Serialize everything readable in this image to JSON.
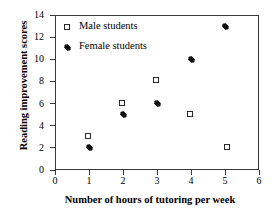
{
  "chart_data": {
    "type": "scatter",
    "title": "",
    "xlabel": "Number of hours of tutoring per week",
    "ylabel": "Reading improvement scores",
    "xlim": [
      0,
      6
    ],
    "ylim": [
      0,
      14
    ],
    "xticks": [
      "0",
      "1",
      "2",
      "3",
      "4",
      "5",
      "6"
    ],
    "yticks": [
      "0",
      "2",
      "4",
      "6",
      "8",
      "10",
      "12",
      "14"
    ],
    "grid": false,
    "legend_position": "top-left-inside",
    "frame": true,
    "series": [
      {
        "name": "Male students",
        "marker": "open-square",
        "color": "#2b2b2b",
        "points": [
          {
            "x": 1,
            "y": 3
          },
          {
            "x": 2,
            "y": 6
          },
          {
            "x": 3,
            "y": 8
          },
          {
            "x": 4,
            "y": 5
          },
          {
            "x": 5.1,
            "y": 2
          }
        ]
      },
      {
        "name": "Female students",
        "marker": "filled-diamond",
        "color": "#0d0d0d",
        "points": [
          {
            "x": 1,
            "y": 2
          },
          {
            "x": 2,
            "y": 5
          },
          {
            "x": 3,
            "y": 6
          },
          {
            "x": 4,
            "y": 10
          },
          {
            "x": 5,
            "y": 13
          }
        ]
      }
    ]
  },
  "legend": {
    "items": [
      {
        "label": "Male students",
        "marker": "open-square"
      },
      {
        "label": "Female students",
        "marker": "filled-diamond"
      }
    ]
  },
  "axes": {
    "x_title": "Number of hours of tutoring per week",
    "y_title": "Reading improvement scores"
  }
}
